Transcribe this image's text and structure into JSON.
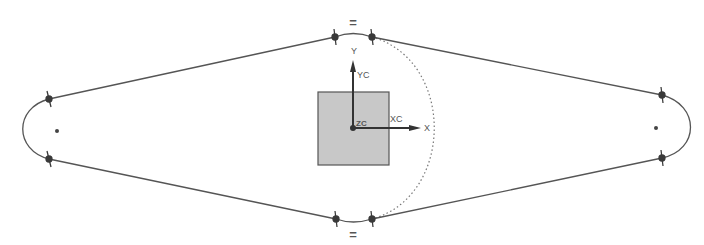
{
  "sketch": {
    "colors": {
      "background": "#ffffff",
      "curve": "#555555",
      "point": "#3a3a3a",
      "square_fill": "#c8c8c8",
      "square_stroke": "#555555",
      "axis": "#333333",
      "dotted": "#777777"
    },
    "constraints": {
      "equal_top": "=",
      "equal_bottom": "="
    },
    "axes": {
      "y_label": "Y",
      "yc_label": "YC",
      "x_label": "X",
      "xc_label": "XC",
      "zc_label": "ZC"
    }
  }
}
